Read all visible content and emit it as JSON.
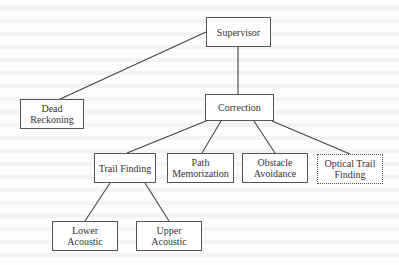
{
  "diagram": {
    "type": "hierarchy",
    "background": "#fdfdfd",
    "line_color": "#444444",
    "nodes": {
      "supervisor": {
        "label": "Supervisor",
        "style": "solid"
      },
      "dead_reckoning": {
        "label": "Dead\nReckoning",
        "style": "solid"
      },
      "correction": {
        "label": "Correction",
        "style": "solid"
      },
      "trail_finding": {
        "label": "Trail Finding",
        "style": "solid"
      },
      "path_memorization": {
        "label": "Path\nMemorization",
        "style": "solid"
      },
      "obstacle_avoidance": {
        "label": "Obstacle\nAvoidance",
        "style": "solid"
      },
      "optical_trail_finding": {
        "label": "Optical Trail\nFinding",
        "style": "dotted"
      },
      "lower_acoustic": {
        "label": "Lower\nAcoustic",
        "style": "solid"
      },
      "upper_acoustic": {
        "label": "Upper\nAcoustic",
        "style": "solid"
      }
    },
    "edges": [
      {
        "from": "Supervisor",
        "to": "Dead Reckoning"
      },
      {
        "from": "Supervisor",
        "to": "Correction"
      },
      {
        "from": "Correction",
        "to": "Trail Finding"
      },
      {
        "from": "Correction",
        "to": "Path Memorization"
      },
      {
        "from": "Correction",
        "to": "Obstacle Avoidance"
      },
      {
        "from": "Correction",
        "to": "Optical Trail Finding"
      },
      {
        "from": "Trail Finding",
        "to": "Lower Acoustic"
      },
      {
        "from": "Trail Finding",
        "to": "Upper Acoustic"
      }
    ]
  }
}
